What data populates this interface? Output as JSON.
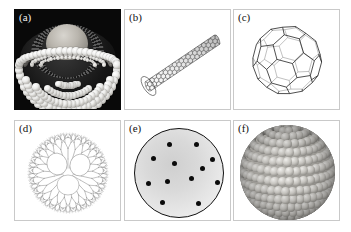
{
  "figure": {
    "background_color": "#ffffff",
    "border_color": "#c9c9c9",
    "columns": 3,
    "rows": 2,
    "panel_count": 6
  },
  "panels": [
    {
      "id": "a",
      "label": "(a)",
      "subject": "liposome",
      "description": "Cutaway liposome / lipid vesicle with phospholipid bilayer of spherical head groups and an encapsulated core",
      "background_color": "#090909",
      "label_color": "#f2f2f2",
      "style": "rendered-3d-grayscale"
    },
    {
      "id": "b",
      "label": "(b)",
      "subject": "carbon-nanotube",
      "description": "Single-walled carbon nanotube drawn as a hexagonal honeycomb lattice cylinder oriented diagonally",
      "background_color": "#ffffff",
      "label_color": "#111111",
      "style": "line-drawing"
    },
    {
      "id": "c",
      "label": "(c)",
      "subject": "fullerene",
      "description": "C60 buckminsterfullerene wireframe, truncated icosahedron of pentagons and hexagons",
      "background_color": "#ffffff",
      "label_color": "#111111",
      "style": "wireframe"
    },
    {
      "id": "d",
      "label": "(d)",
      "subject": "dendrimer",
      "description": "Dendrimer with three central lobes and fine fractal branches radiating outward",
      "background_color": "#ffffff",
      "label_color": "#111111",
      "style": "fine-line-drawing"
    },
    {
      "id": "e",
      "label": "(e)",
      "subject": "quantum-dot-disc",
      "description": "Shaded circular disc outlined in black containing twelve small black dots",
      "background_color": "#ffffff",
      "label_color": "#111111",
      "style": "shaded-circle",
      "dot_count": 12,
      "outline_color": "#111111",
      "fill_color": "#dcdcdc"
    },
    {
      "id": "f",
      "label": "(f)",
      "subject": "nanoparticle",
      "description": "Spherical nanoparticle built from a close-packed lattice of small rendered spheres",
      "background_color": "#ffffff",
      "label_color": "#111111",
      "style": "rendered-3d-grayscale"
    }
  ],
  "panel_e_dots": [
    {
      "x": 33,
      "y": 14
    },
    {
      "x": 60,
      "y": 14
    },
    {
      "x": 17,
      "y": 28
    },
    {
      "x": 76,
      "y": 29
    },
    {
      "x": 38,
      "y": 33
    },
    {
      "x": 66,
      "y": 38
    },
    {
      "x": 12,
      "y": 53
    },
    {
      "x": 81,
      "y": 52
    },
    {
      "x": 55,
      "y": 48
    },
    {
      "x": 31,
      "y": 51
    },
    {
      "x": 26,
      "y": 72
    },
    {
      "x": 62,
      "y": 73
    }
  ]
}
